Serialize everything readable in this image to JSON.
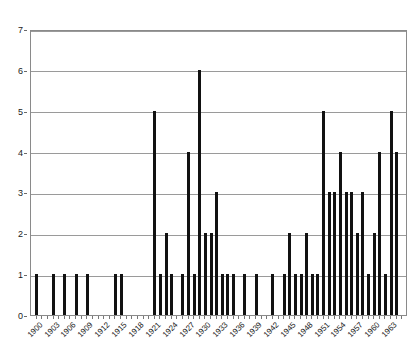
{
  "chart_data": {
    "type": "bar",
    "title": "",
    "subtitle": "",
    "xlabel": "",
    "ylabel": "",
    "grid": true,
    "legend": null,
    "xlim": [
      1899,
      1966
    ],
    "ylim": [
      0,
      7
    ],
    "y_ticks": [
      0,
      1,
      2,
      3,
      4,
      5,
      6,
      7
    ],
    "x_tick_labels": [
      "1900",
      "1903",
      "1906",
      "1909",
      "1912",
      "1915",
      "1918",
      "1921",
      "1924",
      "1927",
      "1930",
      "1933",
      "1936",
      "1939",
      "1942",
      "1945",
      "1948",
      "1951",
      "1954",
      "1957",
      "1960",
      "1963"
    ],
    "x_tick_step": 3,
    "categories": [
      1900,
      1901,
      1902,
      1903,
      1904,
      1905,
      1906,
      1907,
      1908,
      1909,
      1910,
      1911,
      1912,
      1913,
      1914,
      1915,
      1916,
      1917,
      1918,
      1919,
      1920,
      1921,
      1922,
      1923,
      1924,
      1925,
      1926,
      1927,
      1928,
      1929,
      1930,
      1931,
      1932,
      1933,
      1934,
      1935,
      1936,
      1937,
      1938,
      1939,
      1940,
      1941,
      1942,
      1943,
      1944,
      1945,
      1946,
      1947,
      1948,
      1949,
      1950,
      1951,
      1952,
      1953,
      1954,
      1955,
      1956,
      1957,
      1958,
      1959,
      1960,
      1961,
      1962,
      1963,
      1964,
      1965
    ],
    "values": [
      1,
      0,
      0,
      1,
      0,
      1,
      0,
      1,
      0,
      1,
      0,
      0,
      0,
      0,
      1,
      1,
      0,
      0,
      0,
      0,
      0,
      5,
      1,
      2,
      1,
      0,
      1,
      4,
      1,
      6,
      2,
      2,
      3,
      1,
      1,
      1,
      0,
      1,
      0,
      1,
      0,
      0,
      1,
      0,
      1,
      2,
      1,
      1,
      2,
      1,
      1,
      5,
      3,
      3,
      4,
      3,
      3,
      2,
      3,
      1,
      2,
      4,
      1,
      5,
      4,
      0
    ]
  }
}
